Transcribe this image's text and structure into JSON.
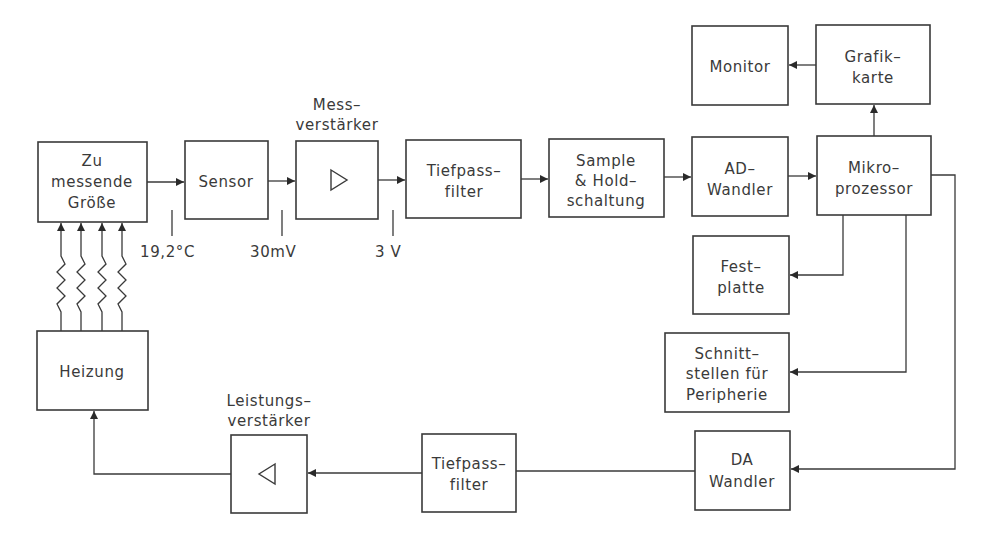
{
  "diagram": {
    "title": "",
    "blocks": {
      "measured_quantity": {
        "lines": [
          "Zu",
          "messende",
          "Größe"
        ]
      },
      "sensor": {
        "lines": [
          "Sensor"
        ]
      },
      "measuring_amplifier": {
        "caption": [
          "Mess–",
          "verstärker"
        ],
        "symbol": "amplifier-triangle-right"
      },
      "lowpass_top": {
        "lines": [
          "Tiefpass–",
          "filter"
        ]
      },
      "sample_hold": {
        "lines": [
          "Sample",
          "& Hold–",
          "schaltung"
        ]
      },
      "ad_converter": {
        "lines": [
          "AD–",
          "Wandler"
        ]
      },
      "microprocessor": {
        "lines": [
          "Mikro–",
          "prozessor"
        ]
      },
      "graphics_card": {
        "lines": [
          "Grafik–",
          "karte"
        ]
      },
      "monitor": {
        "lines": [
          "Monitor"
        ]
      },
      "hard_disk": {
        "lines": [
          "Fest–",
          "platte"
        ]
      },
      "interfaces": {
        "lines": [
          "Schnitt–",
          "stellen für",
          "Peripherie"
        ]
      },
      "da_converter": {
        "lines": [
          "DA",
          "Wandler"
        ]
      },
      "lowpass_bottom": {
        "lines": [
          "Tiefpass–",
          "filter"
        ]
      },
      "power_amplifier": {
        "caption": [
          "Leistungs–",
          "verstärker"
        ],
        "symbol": "amplifier-triangle-left"
      },
      "heater": {
        "lines": [
          "Heizung"
        ]
      }
    },
    "signal_values": {
      "after_quantity": "19,2°C",
      "after_sensor": "30mV",
      "after_amplifier": "3 V"
    },
    "connections": [
      {
        "from": "measured_quantity",
        "to": "sensor"
      },
      {
        "from": "sensor",
        "to": "measuring_amplifier"
      },
      {
        "from": "measuring_amplifier",
        "to": "lowpass_top"
      },
      {
        "from": "lowpass_top",
        "to": "sample_hold"
      },
      {
        "from": "sample_hold",
        "to": "ad_converter"
      },
      {
        "from": "ad_converter",
        "to": "microprocessor"
      },
      {
        "from": "microprocessor",
        "to": "graphics_card"
      },
      {
        "from": "graphics_card",
        "to": "monitor"
      },
      {
        "from": "microprocessor",
        "to": "hard_disk"
      },
      {
        "from": "microprocessor",
        "to": "interfaces"
      },
      {
        "from": "microprocessor",
        "to": "da_converter"
      },
      {
        "from": "da_converter",
        "to": "lowpass_bottom"
      },
      {
        "from": "lowpass_bottom",
        "to": "power_amplifier"
      },
      {
        "from": "power_amplifier",
        "to": "heater"
      },
      {
        "from": "heater",
        "to": "measured_quantity",
        "style": "wavy-heat-arrows",
        "count": 4
      }
    ]
  }
}
